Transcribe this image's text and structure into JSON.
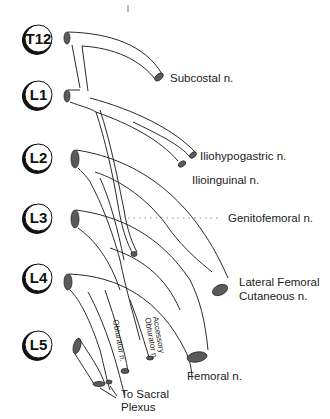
{
  "diagram": {
    "roots": [
      {
        "label": "T12",
        "y": 39
      },
      {
        "label": "L1",
        "y": 95
      },
      {
        "label": "L2",
        "y": 158
      },
      {
        "label": "L3",
        "y": 218
      },
      {
        "label": "L4",
        "y": 278
      },
      {
        "label": "L5",
        "y": 345
      }
    ],
    "nerve_labels": {
      "subcostal": "Subcostal n.",
      "iliohypogastric": "Iliohypogastric n.",
      "ilioinguinal": "Ilioinguinal n.",
      "genitofemoral": "Genitofemoral n.",
      "lfcn_line1": "Lateral Femoral",
      "lfcn_line2": "Cutaneous n.",
      "femoral": "Femoral n.",
      "obturator": "Obturator n.",
      "acc_obturator_line1": "Accessory",
      "acc_obturator_line2": "Obturator n.",
      "sacral_line1": "To Sacral",
      "sacral_line2": "Plexus"
    }
  }
}
